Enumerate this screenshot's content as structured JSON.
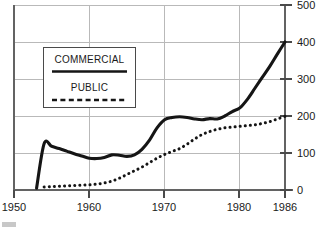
{
  "chart_data": {
    "type": "line",
    "title": "",
    "subtitle": "",
    "xlabel": "",
    "ylabel": "",
    "xlim": [
      1950,
      1986
    ],
    "ylim": [
      0,
      500
    ],
    "grid": true,
    "y_axis_position": "right",
    "legend_position": "upper-left-inside",
    "x_ticks": [
      1950,
      1960,
      1970,
      1980,
      1986
    ],
    "x_tick_labels": [
      "1950",
      "1960",
      "1970",
      "1980",
      "1986"
    ],
    "y_ticks": [
      0,
      100,
      200,
      300,
      400,
      500
    ],
    "y_tick_labels": [
      "0",
      "100",
      "200",
      "300",
      "400",
      "500"
    ],
    "legend": [
      "COMMERCIAL",
      "PUBLIC"
    ],
    "series": [
      {
        "name": "COMMERCIAL",
        "style": "solid",
        "color": "#151515",
        "x": [
          1953,
          1954,
          1955,
          1956,
          1957,
          1958,
          1959,
          1960,
          1961,
          1962,
          1963,
          1964,
          1965,
          1966,
          1967,
          1968,
          1969,
          1970,
          1971,
          1972,
          1973,
          1974,
          1975,
          1976,
          1977,
          1978,
          1979,
          1980,
          1981,
          1982,
          1983,
          1984,
          1985,
          1986
        ],
        "values": [
          5,
          125,
          118,
          112,
          105,
          98,
          92,
          86,
          85,
          88,
          95,
          94,
          91,
          95,
          110,
          135,
          168,
          190,
          196,
          198,
          196,
          192,
          190,
          193,
          192,
          200,
          212,
          222,
          245,
          275,
          305,
          335,
          368,
          400
        ]
      },
      {
        "name": "PUBLIC",
        "style": "dashed",
        "color": "#151515",
        "x": [
          1954,
          1955,
          1956,
          1957,
          1958,
          1959,
          1960,
          1961,
          1962,
          1963,
          1964,
          1965,
          1966,
          1967,
          1968,
          1969,
          1970,
          1971,
          1972,
          1973,
          1974,
          1975,
          1976,
          1977,
          1978,
          1979,
          1980,
          1981,
          1982,
          1983,
          1984,
          1985,
          1986
        ],
        "values": [
          8,
          9,
          10,
          11,
          12,
          13,
          14,
          16,
          19,
          24,
          32,
          42,
          52,
          62,
          74,
          86,
          96,
          104,
          112,
          124,
          138,
          150,
          158,
          164,
          168,
          170,
          172,
          174,
          176,
          180,
          185,
          192,
          199
        ]
      }
    ]
  },
  "axes": {
    "left_axis_name": "left-axis",
    "bottom_axis_name": "bottom-axis",
    "right_axis_name": "right-value-axis"
  }
}
